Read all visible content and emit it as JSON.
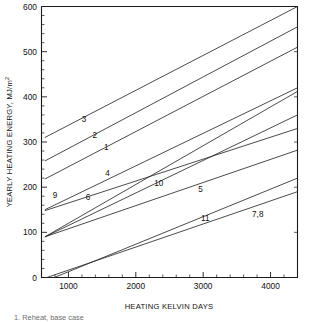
{
  "chart_data": {
    "type": "line",
    "title": "",
    "xlabel": "HEATING KELVIN DAYS",
    "ylabel": "YEARLY HEATING ENERGY, MJ/m",
    "ylabel_superscript": "2",
    "xlim": [
      600,
      4400
    ],
    "ylim": [
      0,
      600
    ],
    "xticks": [
      1000,
      2000,
      3000,
      4000
    ],
    "xticklabels": [
      "1000",
      "2000",
      "3000",
      "4000"
    ],
    "yticks": [
      0,
      100,
      200,
      300,
      400,
      500,
      600
    ],
    "yticklabels": [
      "0",
      "100",
      "200",
      "300",
      "400",
      "500",
      "600"
    ],
    "x_minor_tick_interval": 200,
    "y_minor_tick_interval": 20,
    "grid": false,
    "legend": "inline-curve-labels",
    "series": [
      {
        "name": "3",
        "label": "3",
        "label_x": 1230,
        "label_y": 352,
        "x": [
          650,
          4400
        ],
        "y": [
          310,
          600
        ]
      },
      {
        "name": "2",
        "label": "2",
        "label_x": 1390,
        "label_y": 316,
        "x": [
          650,
          4400
        ],
        "y": [
          258,
          555
        ]
      },
      {
        "name": "1",
        "label": "1",
        "label_x": 1560,
        "label_y": 288,
        "x": [
          650,
          4400
        ],
        "y": [
          218,
          510
        ]
      },
      {
        "name": "4",
        "label": "4",
        "label_x": 1580,
        "label_y": 232,
        "x": [
          650,
          4400
        ],
        "y": [
          150,
          420
        ]
      },
      {
        "name": "9",
        "label": "9",
        "label_x": 800,
        "label_y": 182,
        "x": [
          650,
          4400
        ],
        "y": [
          148,
          330
        ]
      },
      {
        "name": "6",
        "label": "6",
        "label_x": 1290,
        "label_y": 178,
        "x": [
          650,
          4400
        ],
        "y": [
          90,
          412
        ]
      },
      {
        "name": "10",
        "label": "10",
        "label_x": 2340,
        "label_y": 210,
        "x": [
          650,
          4400
        ],
        "y": [
          90,
          360
        ]
      },
      {
        "name": "5",
        "label": "5",
        "label_x": 2960,
        "label_y": 196,
        "x": [
          650,
          4400
        ],
        "y": [
          90,
          282
        ]
      },
      {
        "name": "11",
        "label": "11",
        "label_x": 3030,
        "label_y": 132,
        "x": [
          790,
          4400
        ],
        "y": [
          0,
          220
        ]
      },
      {
        "name": "7,8",
        "label": "7,8",
        "label_x": 3810,
        "label_y": 140,
        "x": [
          680,
          4400
        ],
        "y": [
          0,
          190
        ]
      }
    ],
    "note": "Line 7 and line 8 are coincident and share one label."
  },
  "caption": {
    "item_1": "1. Reheat, base case"
  }
}
